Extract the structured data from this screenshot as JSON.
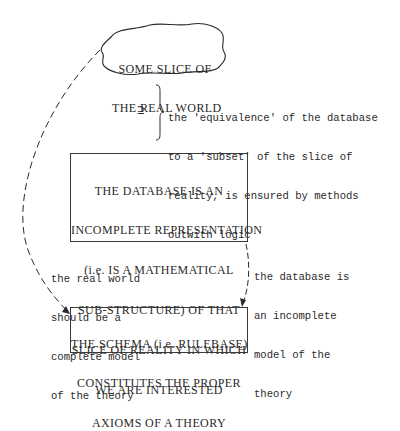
{
  "diagram": {
    "cloud": {
      "lines": [
        "SOME SLICE OF",
        "THE REAL WORLD"
      ]
    },
    "relation_symbol": "⊇",
    "brace_note": {
      "lines": [
        "the 'equivalence' of the database",
        "to a 'subset' of the slice of",
        "reality, is ensured by methods",
        "outwith logic"
      ]
    },
    "database_box": {
      "lines": [
        "THE DATABASE IS AN",
        "INCOMPLETE REPRESENTATION",
        "(i.e. IS A MATHEMATICAL",
        "SUB-STRUCTURE) OF THAT",
        "SLICE OF REALITY IN WHICH",
        "WE ARE INTERESTED"
      ]
    },
    "left_note": {
      "lines": [
        "the real world",
        "should be a",
        "complete model",
        "of the theory"
      ]
    },
    "right_note": {
      "lines": [
        "the database is",
        "an incomplete",
        "model of the",
        "theory"
      ]
    },
    "schema_box": {
      "lines": [
        "THE SCHEMA (i.e. RULEBASE)",
        "CONSTITUTES THE PROPER",
        "AXIOMS OF A THEORY"
      ]
    },
    "colors": {
      "ink": "#2a2a2a",
      "background": "#ffffff"
    }
  }
}
